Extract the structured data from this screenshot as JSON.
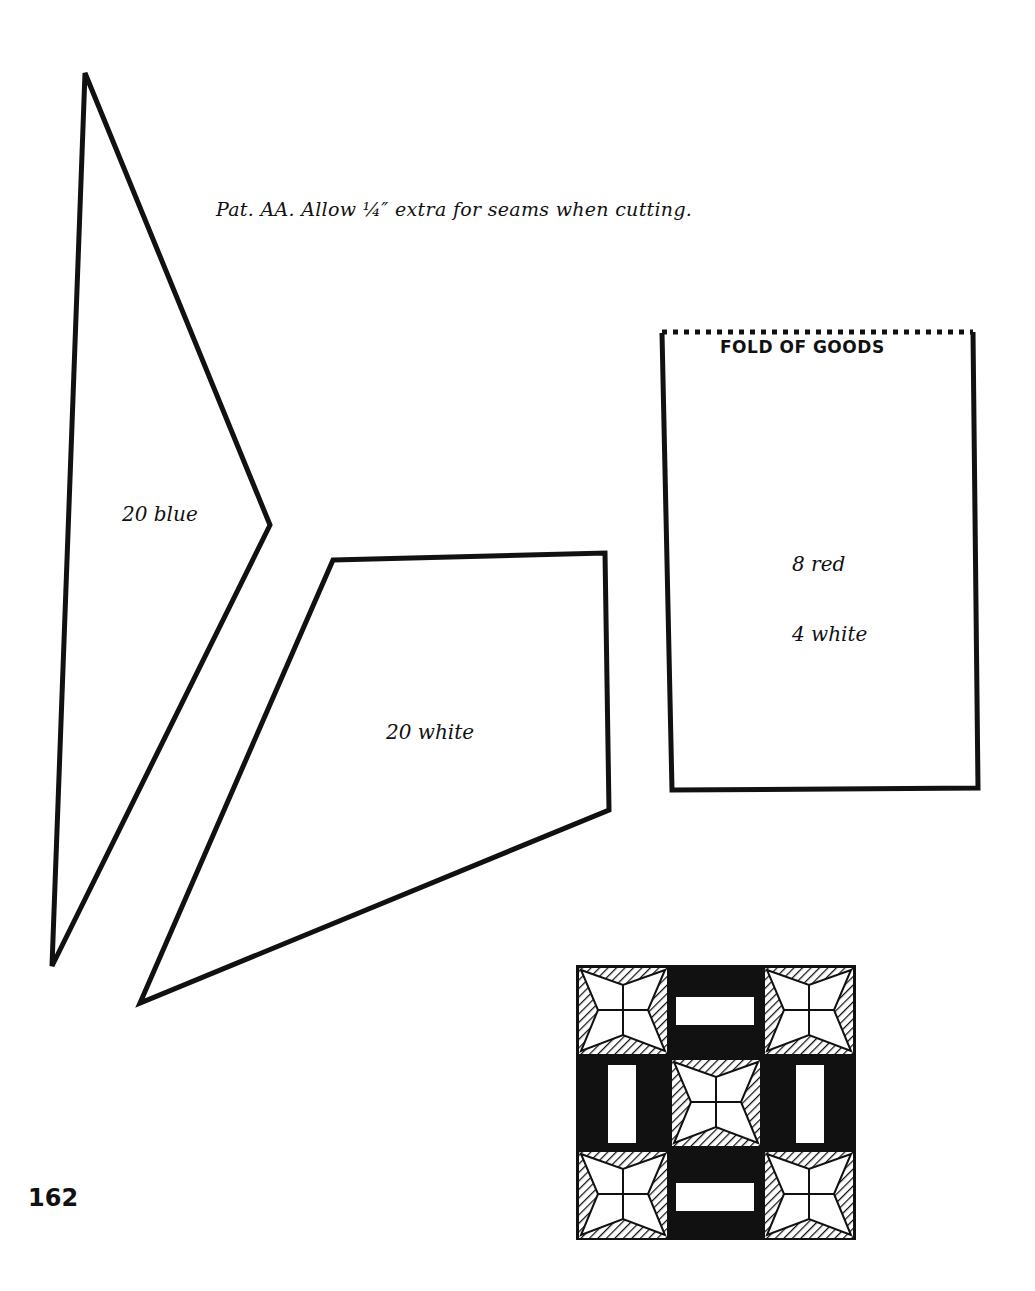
{
  "caption": "Pat. AA.  Allow ¼″ extra for seams when cutting.",
  "pieces": [
    {
      "name": "kite",
      "labels": [
        "20 blue"
      ]
    },
    {
      "name": "trapezoid",
      "labels": [
        "20 white"
      ]
    },
    {
      "name": "rectangle",
      "fold_label": "FOLD OF GOODS",
      "labels": [
        "8 red",
        "4 white"
      ]
    }
  ],
  "page_number": "162"
}
